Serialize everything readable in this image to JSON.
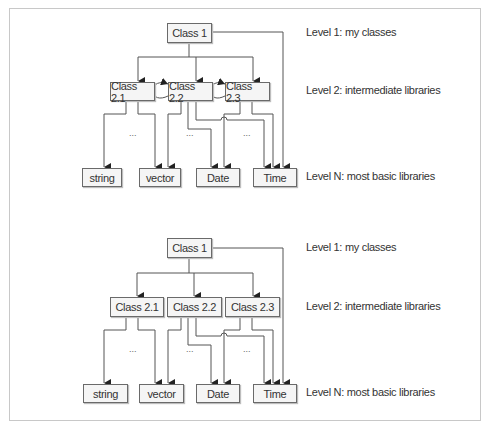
{
  "diagrams": [
    {
      "id": "with-cyclic-dependencies",
      "nodes": {
        "class1": "Class 1",
        "class21": "Class 2.1",
        "class22": "Class 2.2",
        "class23": "Class 2.3",
        "string": "string",
        "vector": "vector",
        "date": "Date",
        "time": "Time"
      },
      "ellipsis": [
        "...",
        "...",
        "..."
      ],
      "level_labels": {
        "level1": "Level 1: my classes",
        "level2": "Level 2: intermediate libraries",
        "levelN": "Level N: most basic libraries"
      }
    },
    {
      "id": "without-cyclic-dependencies",
      "nodes": {
        "class1": "Class 1",
        "class21": "Class 2.1",
        "class22": "Class 2.2",
        "class23": "Class 2.3",
        "string": "string",
        "vector": "vector",
        "date": "Date",
        "time": "Time"
      },
      "ellipsis": [
        "...",
        "...",
        "..."
      ],
      "level_labels": {
        "level1": "Level 1: my classes",
        "level2": "Level 2: intermediate libraries",
        "levelN": "Level N: most basic libraries"
      }
    }
  ],
  "colors": {
    "line": "#555555",
    "node_fill": "#f5f5f5",
    "node_border": "#6a6a6a",
    "frame": "#c8c8c8"
  }
}
